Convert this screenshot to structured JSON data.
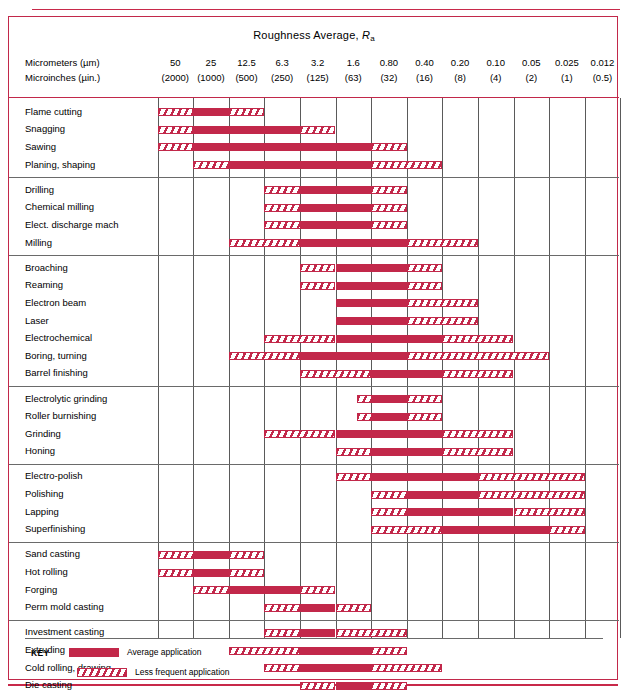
{
  "title": {
    "text": "Roughness Average, ",
    "symbol": "R",
    "subscript": "a"
  },
  "axis": {
    "row1_label": "Micrometers (µm)",
    "row2_label": "Microinches (µin.)",
    "micrometers": [
      "50",
      "25",
      "12.5",
      "6.3",
      "3.2",
      "1.6",
      "0.80",
      "0.40",
      "0.20",
      "0.10",
      "0.05",
      "0.025",
      "0.012"
    ],
    "microinches": [
      "(2000)",
      "(1000)",
      "(500)",
      "(250)",
      "(125)",
      "(63)",
      "(32)",
      "(16)",
      "(8)",
      "(4)",
      "(2)",
      "(1)",
      "(0.5)"
    ]
  },
  "key": {
    "word": "KEY",
    "average_label": "Average application",
    "less_label": "Less frequent application"
  },
  "colors": {
    "red": "#c2284a",
    "grid": "#5a5a5a",
    "group_separator": "#6a6a6a"
  },
  "chart_data": {
    "type": "bar",
    "title": "Roughness Average, Ra",
    "xlabel": "Roughness Average Ra — Micrometers (µm) / Microinches (µin.)",
    "ylabel": "Process",
    "categories": [
      "50",
      "25",
      "12.5",
      "6.3",
      "3.2",
      "1.6",
      "0.80",
      "0.40",
      "0.20",
      "0.10",
      "0.05",
      "0.025",
      "0.012"
    ],
    "legend": [
      "Average application",
      "Less frequent application"
    ],
    "legend_position": "bottom-left",
    "grid": true,
    "note": "Column index 0 = 50 µm (2000 µin.) ... index 12 = 0.012 µm (0.5 µin.). Ranges are given as [start_col, end_col] inclusive using column indices.",
    "groups": [
      {
        "name": "Machining / rough removal",
        "rows": [
          {
            "process": "Flame cutting",
            "average": [
              1,
              1
            ],
            "less": [
              [
                0,
                0
              ],
              [
                2,
                2
              ]
            ]
          },
          {
            "process": "Snagging",
            "average": [
              1,
              3
            ],
            "less": [
              [
                0,
                0
              ],
              [
                4,
                4
              ]
            ]
          },
          {
            "process": "Sawing",
            "average": [
              1,
              5
            ],
            "less": [
              [
                0,
                0
              ],
              [
                6,
                6
              ]
            ]
          },
          {
            "process": "Planing, shaping",
            "average": [
              2,
              5
            ],
            "less": [
              [
                1,
                1
              ],
              [
                6,
                7
              ]
            ]
          }
        ]
      },
      {
        "name": "Drilling / EDM / milling",
        "rows": [
          {
            "process": "Drilling",
            "average": [
              4,
              5
            ],
            "less": [
              [
                3,
                3
              ],
              [
                6,
                6
              ]
            ]
          },
          {
            "process": "Chemical milling",
            "average": [
              4,
              5
            ],
            "less": [
              [
                3,
                3
              ],
              [
                6,
                6
              ]
            ]
          },
          {
            "process": "Elect. discharge mach",
            "average": [
              4,
              5
            ],
            "less": [
              [
                3,
                3.5
              ],
              [
                6,
                6
              ]
            ]
          },
          {
            "process": "Milling",
            "average": [
              4,
              6
            ],
            "less": [
              [
                2,
                3
              ],
              [
                7,
                8
              ]
            ]
          }
        ]
      },
      {
        "name": "Broaching / reaming / beam / boring",
        "rows": [
          {
            "process": "Broaching",
            "average": [
              5,
              6
            ],
            "less": [
              [
                4,
                4
              ],
              [
                7,
                7
              ]
            ]
          },
          {
            "process": "Reaming",
            "average": [
              5,
              6
            ],
            "less": [
              [
                4,
                4
              ],
              [
                7,
                7
              ]
            ]
          },
          {
            "process": "Electron beam",
            "average": [
              5,
              6
            ],
            "less": [
              [
                7,
                8
              ]
            ]
          },
          {
            "process": "Laser",
            "average": [
              5,
              6
            ],
            "less": [
              [
                7,
                8
              ]
            ]
          },
          {
            "process": "Electrochemical",
            "average": [
              5,
              7
            ],
            "less": [
              [
                3,
                4
              ],
              [
                8,
                9
              ]
            ]
          },
          {
            "process": "Boring, turning",
            "average": [
              4,
              6
            ],
            "less": [
              [
                2,
                3
              ],
              [
                7,
                10
              ]
            ]
          },
          {
            "process": "Barrel finishing",
            "average": [
              6,
              7
            ],
            "less": [
              [
                4,
                5
              ],
              [
                8,
                9
              ]
            ]
          }
        ]
      },
      {
        "name": "Grinding / honing",
        "rows": [
          {
            "process": "Electrolytic grinding",
            "average": [
              6,
              6
            ],
            "less": [
              [
                5.6,
                5.9
              ],
              [
                7,
                7
              ]
            ]
          },
          {
            "process": "Roller burnishing",
            "average": [
              6,
              6
            ],
            "less": [
              [
                5.6,
                5.9
              ],
              [
                7,
                7
              ]
            ]
          },
          {
            "process": "Grinding",
            "average": [
              5,
              7
            ],
            "less": [
              [
                3,
                4
              ],
              [
                8,
                9
              ]
            ]
          },
          {
            "process": "Honing",
            "average": [
              6,
              7
            ],
            "less": [
              [
                5,
                5
              ],
              [
                8,
                9
              ]
            ]
          }
        ]
      },
      {
        "name": "Polishing / lapping",
        "rows": [
          {
            "process": "Electro-polish",
            "average": [
              6,
              8
            ],
            "less": [
              [
                5,
                5
              ],
              [
                9,
                11
              ]
            ]
          },
          {
            "process": "Polishing",
            "average": [
              7,
              8
            ],
            "less": [
              [
                6,
                6
              ],
              [
                9,
                11
              ]
            ]
          },
          {
            "process": "Lapping",
            "average": [
              7,
              9
            ],
            "less": [
              [
                6,
                6
              ],
              [
                10,
                11
              ]
            ]
          },
          {
            "process": "Superfinishing",
            "average": [
              8,
              10
            ],
            "less": [
              [
                6,
                7
              ],
              [
                11,
                11
              ]
            ]
          }
        ]
      },
      {
        "name": "Casting / forming",
        "rows": [
          {
            "process": "Sand casting",
            "average": [
              1,
              1
            ],
            "less": [
              [
                0,
                0.7
              ],
              [
                2,
                2
              ]
            ]
          },
          {
            "process": "Hot rolling",
            "average": [
              1,
              1
            ],
            "less": [
              [
                0,
                0
              ],
              [
                2,
                2
              ]
            ]
          },
          {
            "process": "Forging",
            "average": [
              2,
              3
            ],
            "less": [
              [
                1,
                1
              ],
              [
                4,
                4
              ]
            ]
          },
          {
            "process": "Perm mold casting",
            "average": [
              4,
              4
            ],
            "less": [
              [
                3,
                3
              ],
              [
                5,
                5
              ]
            ]
          }
        ]
      },
      {
        "name": "Investment / extruding / die casting",
        "rows": [
          {
            "process": "Investment casting",
            "average": [
              4,
              4
            ],
            "less": [
              [
                3,
                3
              ],
              [
                5,
                6
              ]
            ]
          },
          {
            "process": "Extruding",
            "average": [
              4,
              5
            ],
            "less": [
              [
                2,
                3
              ],
              [
                6,
                6
              ]
            ]
          },
          {
            "process": "Cold rolling, drawing",
            "average": [
              4,
              5
            ],
            "less": [
              [
                3,
                3
              ],
              [
                6,
                7
              ]
            ]
          },
          {
            "process": "Die casting",
            "average": [
              5,
              5
            ],
            "less": [
              [
                4,
                4
              ],
              [
                6,
                6
              ]
            ]
          }
        ]
      }
    ]
  }
}
